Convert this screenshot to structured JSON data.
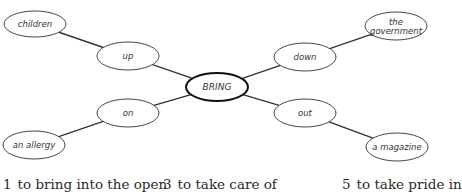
{
  "diagram": {
    "hub": {
      "label": "BRING",
      "cx": 217,
      "cy": 87,
      "rx": 31,
      "ry": 14
    },
    "nodes": [
      {
        "id": "up",
        "label": "up",
        "cx": 128,
        "cy": 56,
        "rx": 31,
        "ry": 14,
        "role": "particle"
      },
      {
        "id": "down",
        "label": "down",
        "cx": 305,
        "cy": 57,
        "rx": 31,
        "ry": 14,
        "role": "particle"
      },
      {
        "id": "on",
        "label": "on",
        "cx": 128,
        "cy": 113,
        "rx": 31,
        "ry": 14,
        "role": "particle"
      },
      {
        "id": "out",
        "label": "out",
        "cx": 305,
        "cy": 113,
        "rx": 31,
        "ry": 14,
        "role": "particle"
      },
      {
        "id": "children",
        "label": "children",
        "cx": 35,
        "cy": 24,
        "rx": 31,
        "ry": 13,
        "role": "object"
      },
      {
        "id": "government",
        "label": "the government",
        "label_lines": [
          "the",
          "government"
        ],
        "cx": 396,
        "cy": 26,
        "rx": 31,
        "ry": 14,
        "role": "object"
      },
      {
        "id": "allergy",
        "label": "an allergy",
        "cx": 34,
        "cy": 145,
        "rx": 31,
        "ry": 14,
        "role": "object"
      },
      {
        "id": "magazine",
        "label": "a magazine",
        "cx": 397,
        "cy": 147,
        "rx": 31,
        "ry": 14,
        "role": "object"
      }
    ],
    "edges": [
      {
        "from": "hub",
        "to": "up"
      },
      {
        "from": "hub",
        "to": "down"
      },
      {
        "from": "hub",
        "to": "on"
      },
      {
        "from": "hub",
        "to": "out"
      },
      {
        "from": "up",
        "to": "children"
      },
      {
        "from": "down",
        "to": "government"
      },
      {
        "from": "on",
        "to": "allergy"
      },
      {
        "from": "out",
        "to": "magazine"
      }
    ],
    "colors": {
      "stroke": "#333333",
      "hub_stroke": "#111111",
      "fill": "#ffffff",
      "text": "#333333"
    }
  },
  "definitions": [
    {
      "number": "1",
      "text": "to bring into the open",
      "x": 3
    },
    {
      "number": "3",
      "text": "to take care of",
      "x": 163
    },
    {
      "number": "5",
      "text": "to take pride in",
      "x": 342
    }
  ]
}
